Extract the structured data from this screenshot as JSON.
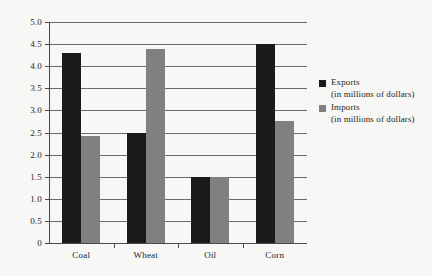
{
  "chart_data": {
    "type": "bar",
    "title": "",
    "subtitle": "",
    "xlabel": "",
    "ylabel": "",
    "categories": [
      "Coal",
      "Wheat",
      "Oil",
      "Corn"
    ],
    "series": [
      {
        "name": "Exports",
        "units": "(in millions of dollars)",
        "color": "#1a1a1a",
        "values": [
          4.3,
          2.5,
          1.5,
          4.5
        ]
      },
      {
        "name": "Imports",
        "units": "(in millions of dollars)",
        "color": "#808080",
        "values": [
          2.42,
          4.38,
          1.5,
          2.75
        ]
      }
    ],
    "ylim": [
      0,
      5.0
    ],
    "ytick_values": [
      5.0,
      4.5,
      4.0,
      3.5,
      3.0,
      2.5,
      2.0,
      1.5,
      1.0,
      0.5,
      0
    ],
    "ytick_labels": [
      "5.0",
      "4.5",
      "4.0",
      "3.5",
      "3.0",
      "2.5",
      "2.0",
      "1.5",
      "1.0",
      "0.5",
      "0"
    ],
    "grid": true,
    "grid_axis": "y",
    "legend_position": "right",
    "background_color": "#f7f7f5",
    "gridline_color": "#6b6b6b",
    "axis_color": "#4a4a4a"
  }
}
